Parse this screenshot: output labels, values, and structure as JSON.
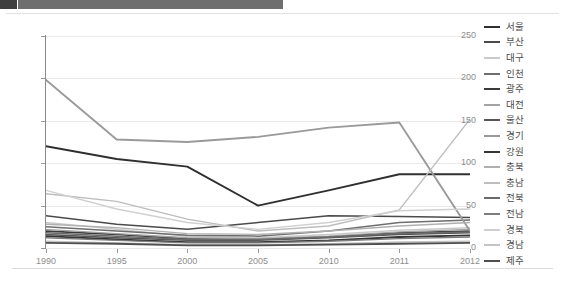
{
  "window": {
    "topbar_left_label": "",
    "topbar_right_label": ""
  },
  "chart_data": {
    "type": "line",
    "title": "",
    "subtitle": "",
    "xlabel": "",
    "ylabel": "",
    "categories": [
      "1990",
      "1995",
      "2000",
      "2005",
      "2010",
      "2011",
      "2012"
    ],
    "x_tick_labels": [
      "1990",
      "1995",
      "2000",
      "2005",
      "2010",
      "2011",
      "2012"
    ],
    "y_tick_labels": [
      "0",
      "50",
      "100",
      "150",
      "200",
      "250"
    ],
    "y_ticks": [
      0,
      50,
      100,
      150,
      200,
      250
    ],
    "ylim": [
      0,
      250
    ],
    "grid": true,
    "grid_axis": "y",
    "legend_position": "right",
    "series": [
      {
        "name": "서울",
        "color": "#2f2f2f",
        "width": 1.9,
        "values": [
          120,
          105,
          96,
          50,
          68,
          87,
          87
        ]
      },
      {
        "name": "부산",
        "color": "#4a4a4a",
        "width": 1.5,
        "values": [
          38,
          28,
          22,
          30,
          38,
          37,
          36
        ]
      },
      {
        "name": "대구",
        "color": "#c9c9c9",
        "width": 1.5,
        "values": [
          30,
          22,
          14,
          12,
          16,
          21,
          24
        ]
      },
      {
        "name": "인천",
        "color": "#6e6e6e",
        "width": 1.5,
        "values": [
          25,
          20,
          15,
          14,
          20,
          30,
          33
        ]
      },
      {
        "name": "광주",
        "color": "#3a3a3a",
        "width": 1.7,
        "values": [
          20,
          16,
          11,
          10,
          13,
          18,
          20
        ]
      },
      {
        "name": "대전",
        "color": "#a3a3a3",
        "width": 1.4,
        "values": [
          22,
          17,
          12,
          11,
          14,
          19,
          22
        ]
      },
      {
        "name": "울산",
        "color": "#565656",
        "width": 1.5,
        "values": [
          16,
          12,
          9,
          9,
          12,
          16,
          18
        ]
      },
      {
        "name": "경기",
        "color": "#9a9a9a",
        "width": 1.9,
        "values": [
          198,
          128,
          125,
          131,
          142,
          148,
          20
        ]
      },
      {
        "name": "강원",
        "color": "#353535",
        "width": 1.8,
        "values": [
          14,
          10,
          7,
          7,
          9,
          13,
          15
        ]
      },
      {
        "name": "충북",
        "color": "#b0b0b0",
        "width": 1.4,
        "values": [
          28,
          24,
          17,
          16,
          20,
          26,
          30
        ]
      },
      {
        "name": "충남",
        "color": "#bdbdbd",
        "width": 1.4,
        "values": [
          64,
          55,
          34,
          20,
          26,
          45,
          152
        ]
      },
      {
        "name": "전북",
        "color": "#6a6a6a",
        "width": 1.5,
        "values": [
          18,
          14,
          10,
          10,
          13,
          17,
          19
        ]
      },
      {
        "name": "전남",
        "color": "#7d7d7d",
        "width": 1.4,
        "values": [
          12,
          9,
          6,
          6,
          8,
          11,
          13
        ]
      },
      {
        "name": "경북",
        "color": "#d0d0d0",
        "width": 1.4,
        "values": [
          68,
          46,
          30,
          22,
          30,
          44,
          46
        ]
      },
      {
        "name": "경남",
        "color": "#c4c4c4",
        "width": 1.4,
        "values": [
          8,
          6,
          4,
          4,
          5,
          7,
          8
        ]
      },
      {
        "name": "제주",
        "color": "#4f4f4f",
        "width": 1.8,
        "values": [
          6,
          5,
          3,
          3,
          4,
          5,
          6
        ]
      }
    ]
  }
}
